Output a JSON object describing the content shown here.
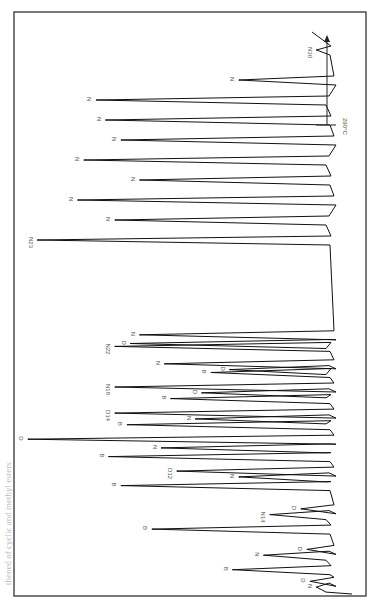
{
  "caption": "thened of cyclic and methyl esters",
  "chart_data": {
    "type": "line",
    "title": "",
    "orientation": "rotated-90",
    "xlabel": "retention (time / temperature)",
    "ylabel": "detector response",
    "temperature_marker": "290°C",
    "peaks": [
      {
        "label": "N",
        "pos": 0.01,
        "height": 0.05
      },
      {
        "label": "D",
        "pos": 0.03,
        "height": 0.07
      },
      {
        "label": "B",
        "pos": 0.07,
        "height": 0.32
      },
      {
        "label": "N",
        "pos": 0.12,
        "height": 0.22
      },
      {
        "label": "D",
        "pos": 0.14,
        "height": 0.08
      },
      {
        "label": "B",
        "pos": 0.21,
        "height": 0.58
      },
      {
        "label": "N14",
        "pos": 0.26,
        "height": 0.2
      },
      {
        "label": "D",
        "pos": 0.28,
        "height": 0.1
      },
      {
        "label": "B",
        "pos": 0.36,
        "height": 0.68
      },
      {
        "label": "N",
        "pos": 0.39,
        "height": 0.3
      },
      {
        "label": "D12",
        "pos": 0.41,
        "height": 0.5
      },
      {
        "label": "B",
        "pos": 0.46,
        "height": 0.72
      },
      {
        "label": "N",
        "pos": 0.49,
        "height": 0.55
      },
      {
        "label": "D",
        "pos": 0.52,
        "height": 0.98
      },
      {
        "label": "B",
        "pos": 0.57,
        "height": 0.66
      },
      {
        "label": "N",
        "pos": 0.59,
        "height": 0.44
      },
      {
        "label": "D14",
        "pos": 0.61,
        "height": 0.7
      },
      {
        "label": "B",
        "pos": 0.66,
        "height": 0.52
      },
      {
        "label": "D",
        "pos": 0.68,
        "height": 0.42
      },
      {
        "label": "N18",
        "pos": 0.7,
        "height": 0.7
      },
      {
        "label": "B",
        "pos": 0.75,
        "height": 0.39
      },
      {
        "label": "D",
        "pos": 0.76,
        "height": 0.33
      },
      {
        "label": "N",
        "pos": 0.78,
        "height": 0.54
      },
      {
        "label": "N22",
        "pos": 0.84,
        "height": 0.7
      },
      {
        "label": "D",
        "pos": 0.85,
        "height": 0.65
      },
      {
        "label": "N",
        "pos": 0.88,
        "height": 0.62
      }
    ],
    "peaks_upper": [
      {
        "label": "N23",
        "pos": 0.0,
        "height": 0.95
      },
      {
        "label": "N",
        "pos": 0.1,
        "height": 0.7
      },
      {
        "label": "N",
        "pos": 0.2,
        "height": 0.82
      },
      {
        "label": "N",
        "pos": 0.3,
        "height": 0.62
      },
      {
        "label": "N",
        "pos": 0.4,
        "height": 0.8
      },
      {
        "label": "N",
        "pos": 0.5,
        "height": 0.68
      },
      {
        "label": "N",
        "pos": 0.6,
        "height": 0.73
      },
      {
        "label": "N",
        "pos": 0.7,
        "height": 0.76
      },
      {
        "label": "N",
        "pos": 0.8,
        "height": 0.3
      },
      {
        "label": "N30",
        "pos": 0.95,
        "height": 0.05
      }
    ]
  }
}
